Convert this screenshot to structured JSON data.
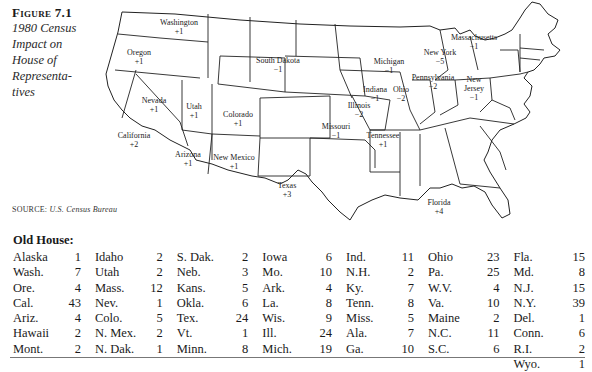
{
  "caption": {
    "figure_label": "Figure 7.1",
    "title_lines": [
      "1980 Census",
      "Impact on",
      "House of",
      "Representa-",
      "tives"
    ]
  },
  "map": {
    "labels": [
      {
        "state": "Washington",
        "change": "+1"
      },
      {
        "state": "Oregon",
        "change": "+1"
      },
      {
        "state": "California",
        "change": "+2"
      },
      {
        "state": "Nevada",
        "change": "+1"
      },
      {
        "state": "Utah",
        "change": "+1"
      },
      {
        "state": "Arizona",
        "change": "+1"
      },
      {
        "state": "Colorado",
        "change": "+1"
      },
      {
        "state": "New Mexico",
        "change": "+1"
      },
      {
        "state": "South Dakota",
        "change": "−1"
      },
      {
        "state": "Texas",
        "change": "+3"
      },
      {
        "state": "Missouri",
        "change": "−1"
      },
      {
        "state": "Illinois",
        "change": "−2"
      },
      {
        "state": "Indiana",
        "change": "−1"
      },
      {
        "state": "Michigan",
        "change": "−1"
      },
      {
        "state": "Ohio",
        "change": "−2"
      },
      {
        "state": "Tennessee",
        "change": "+1"
      },
      {
        "state": "Florida",
        "change": "+4"
      },
      {
        "state": "Pennsylvania",
        "change": "−2"
      },
      {
        "state": "New York",
        "change": "−5"
      },
      {
        "state": "Massachusetts",
        "change": "−1"
      },
      {
        "state": "New Jersey",
        "change": "−1"
      }
    ]
  },
  "source": {
    "label": "SOURCE:",
    "text": "U.S. Census Bureau"
  },
  "old_house": {
    "title": "Old House:",
    "columns": [
      [
        [
          "Alaska",
          "1"
        ],
        [
          "Wash.",
          "7"
        ],
        [
          "Ore.",
          "4"
        ],
        [
          "Cal.",
          "43"
        ],
        [
          "Ariz.",
          "4"
        ],
        [
          "Hawaii",
          "2"
        ],
        [
          "Mont.",
          "2"
        ]
      ],
      [
        [
          "Idaho",
          "2"
        ],
        [
          "Utah",
          "2"
        ],
        [
          "Mass.",
          "12"
        ],
        [
          "Nev.",
          "1"
        ],
        [
          "Colo.",
          "5"
        ],
        [
          "N. Mex.",
          "2"
        ],
        [
          "N. Dak.",
          "1"
        ]
      ],
      [
        [
          "S. Dak.",
          "2"
        ],
        [
          "Neb.",
          "3"
        ],
        [
          "Kans.",
          "5"
        ],
        [
          "Okla.",
          "6"
        ],
        [
          "Tex.",
          "24"
        ],
        [
          "Vt.",
          "1"
        ],
        [
          "Minn.",
          "8"
        ]
      ],
      [
        [
          "Iowa",
          "6"
        ],
        [
          "Mo.",
          "10"
        ],
        [
          "Ark.",
          "4"
        ],
        [
          "La.",
          "8"
        ],
        [
          "Wis.",
          "9"
        ],
        [
          "Ill.",
          "24"
        ],
        [
          "Mich.",
          "19"
        ]
      ],
      [
        [
          "Ind.",
          "11"
        ],
        [
          "N.H.",
          "2"
        ],
        [
          "Ky.",
          "7"
        ],
        [
          "Tenn.",
          "8"
        ],
        [
          "Miss.",
          "5"
        ],
        [
          "Ala.",
          "7"
        ],
        [
          "Ga.",
          "10"
        ]
      ],
      [
        [
          "Ohio",
          "23"
        ],
        [
          "Pa.",
          "25"
        ],
        [
          "W.V.",
          "4"
        ],
        [
          "Va.",
          "10"
        ],
        [
          "Maine",
          "2"
        ],
        [
          "N.C.",
          "11"
        ],
        [
          "S.C.",
          "6"
        ]
      ],
      [
        [
          "Fla.",
          "15"
        ],
        [
          "Md.",
          "8"
        ],
        [
          "N.J.",
          "15"
        ],
        [
          "N.Y.",
          "39"
        ],
        [
          "Del.",
          "1"
        ],
        [
          "Conn.",
          "6"
        ],
        [
          "R.I.",
          "2"
        ],
        [
          "Wyo.",
          "1"
        ]
      ]
    ]
  }
}
